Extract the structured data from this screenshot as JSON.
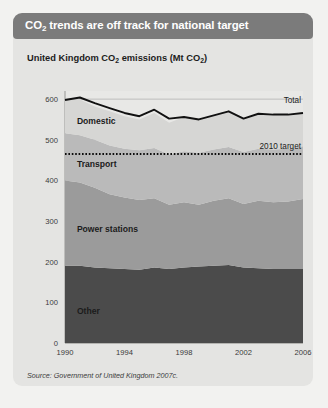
{
  "header": {
    "title_prefix": "CO",
    "title_sub": "2",
    "title_rest": " trends are off track for national target",
    "bar_color": "#7b7b7b"
  },
  "chart_title": {
    "prefix": "United Kingdom CO",
    "sub1": "2",
    "mid": " emissions (Mt CO",
    "sub2": "2",
    "suffix": ")"
  },
  "source": "Source: Government of United Kingdom 2007c.",
  "colors": {
    "card": "#e4e4e2",
    "page": "#f2f2f0",
    "domestic": "#d6d6d4",
    "transport": "#bababa",
    "power": "#9b9b9b",
    "other": "#4b4b4b",
    "total_line": "#111111",
    "target_line": "#0d0d0d",
    "gridline": "#b4b4b2"
  },
  "chart_data": {
    "type": "area",
    "title": "United Kingdom CO2 emissions (Mt CO2)",
    "xlabel": "",
    "ylabel": "Mt CO2",
    "ylim": [
      0,
      620
    ],
    "yticks": [
      0,
      100,
      200,
      300,
      400,
      500,
      600
    ],
    "xlim": [
      1990,
      2006
    ],
    "xticks": [
      1990,
      1994,
      1998,
      2002,
      2006
    ],
    "xtick_labels": [
      "1990",
      "1994",
      "1998",
      "2002",
      "2006"
    ],
    "grid": true,
    "legend": "inline-labels",
    "stacked": true,
    "x": [
      1990,
      1991,
      1992,
      1993,
      1994,
      1995,
      1996,
      1997,
      1998,
      1999,
      2000,
      2001,
      2002,
      2003,
      2004,
      2005,
      2006
    ],
    "series": [
      {
        "name": "Other",
        "label": "Other",
        "color": "#4b4b4b",
        "values": [
          190,
          190,
          186,
          184,
          182,
          180,
          186,
          182,
          186,
          188,
          190,
          192,
          186,
          184,
          182,
          182,
          182
        ]
      },
      {
        "name": "Power stations",
        "label": "Power stations",
        "color": "#9b9b9b",
        "values": [
          210,
          205,
          196,
          182,
          176,
          172,
          170,
          158,
          160,
          152,
          160,
          164,
          156,
          166,
          164,
          166,
          172
        ]
      },
      {
        "name": "Transport",
        "label": "Transport",
        "color": "#bababa",
        "values": [
          116,
          116,
          118,
          120,
          120,
          122,
          124,
          124,
          126,
          128,
          126,
          126,
          128,
          128,
          130,
          130,
          130
        ]
      },
      {
        "name": "Domestic",
        "label": "Domestic",
        "color": "#d6d6d4",
        "values": [
          82,
          88,
          82,
          84,
          80,
          76,
          86,
          78,
          84,
          82,
          84,
          88,
          82,
          86,
          86,
          84,
          82
        ]
      }
    ],
    "total_line": {
      "name": "Total",
      "label": "Total",
      "color": "#111111",
      "values": [
        598,
        604,
        590,
        578,
        566,
        558,
        574,
        552,
        556,
        550,
        560,
        570,
        552,
        564,
        562,
        562,
        566
      ]
    },
    "target_line": {
      "name": "2010 target",
      "label": "2010 target",
      "value": 465,
      "style": "dotted",
      "color": "#0d0d0d"
    },
    "band_labels": [
      {
        "text": "Domestic",
        "x": 1990.8,
        "y": 540
      },
      {
        "text": "Transport",
        "x": 1990.8,
        "y": 432
      },
      {
        "text": "Power stations",
        "x": 1990.8,
        "y": 272
      },
      {
        "text": "Other",
        "x": 1990.8,
        "y": 72
      }
    ]
  }
}
